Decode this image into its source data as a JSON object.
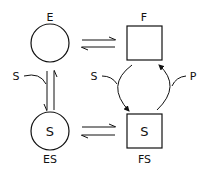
{
  "diagram": {
    "type": "enzyme-state-cycle",
    "nodes": {
      "E": {
        "label": "E",
        "shape": "circle",
        "inner": ""
      },
      "F": {
        "label": "F",
        "shape": "square",
        "inner": ""
      },
      "ES": {
        "label": "ES",
        "shape": "circle",
        "inner": "S"
      },
      "FS": {
        "label": "FS",
        "shape": "square",
        "inner": "S"
      }
    },
    "edges": [
      {
        "from": "E",
        "to": "F",
        "type": "equilibrium"
      },
      {
        "from": "E",
        "to": "ES",
        "type": "equilibrium",
        "input": "S"
      },
      {
        "from": "ES",
        "to": "FS",
        "type": "equilibrium"
      },
      {
        "from": "F",
        "to": "FS",
        "type": "cycle",
        "input": "S",
        "output": "P"
      }
    ],
    "labels": {
      "substrate_left": "S",
      "substrate_cycle": "S",
      "product": "P"
    },
    "colors": {
      "stroke": "#111111",
      "background": "#ffffff"
    }
  }
}
